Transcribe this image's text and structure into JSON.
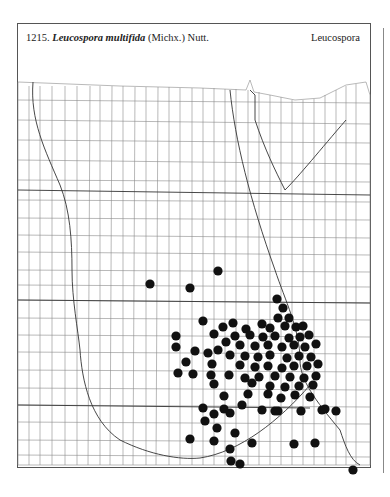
{
  "header": {
    "number": "1215.",
    "species": "Leucospora multifida",
    "authority": "(Michx.) Nutt.",
    "genus": "Leucospora"
  },
  "map": {
    "dot_color": "#111111",
    "line_color": "#777777",
    "dot_radius": 4.6,
    "occurrences": [
      [
        150,
        284
      ],
      [
        190,
        288
      ],
      [
        218,
        271
      ],
      [
        353,
        470
      ],
      [
        277,
        299
      ],
      [
        283,
        308
      ],
      [
        278,
        318
      ],
      [
        289,
        318
      ],
      [
        203,
        321
      ],
      [
        233,
        323
      ],
      [
        223,
        327
      ],
      [
        246,
        329
      ],
      [
        262,
        324
      ],
      [
        270,
        328
      ],
      [
        285,
        326
      ],
      [
        296,
        327
      ],
      [
        303,
        326
      ],
      [
        176,
        336
      ],
      [
        214,
        334
      ],
      [
        235,
        336
      ],
      [
        250,
        335
      ],
      [
        263,
        337
      ],
      [
        275,
        336
      ],
      [
        289,
        338
      ],
      [
        300,
        337
      ],
      [
        309,
        335
      ],
      [
        176,
        347
      ],
      [
        226,
        342
      ],
      [
        240,
        345
      ],
      [
        255,
        346
      ],
      [
        268,
        345
      ],
      [
        282,
        347
      ],
      [
        294,
        345
      ],
      [
        305,
        347
      ],
      [
        316,
        344
      ],
      [
        195,
        351
      ],
      [
        208,
        353
      ],
      [
        218,
        350
      ],
      [
        230,
        355
      ],
      [
        245,
        356
      ],
      [
        258,
        357
      ],
      [
        270,
        355
      ],
      [
        287,
        358
      ],
      [
        299,
        356
      ],
      [
        311,
        357
      ],
      [
        186,
        362
      ],
      [
        212,
        364
      ],
      [
        240,
        365
      ],
      [
        255,
        367
      ],
      [
        268,
        366
      ],
      [
        282,
        368
      ],
      [
        294,
        366
      ],
      [
        307,
        366
      ],
      [
        318,
        364
      ],
      [
        178,
        373
      ],
      [
        193,
        374
      ],
      [
        211,
        375
      ],
      [
        229,
        375
      ],
      [
        245,
        378
      ],
      [
        259,
        377
      ],
      [
        275,
        376
      ],
      [
        290,
        377
      ],
      [
        304,
        378
      ],
      [
        316,
        376
      ],
      [
        214,
        384
      ],
      [
        252,
        383
      ],
      [
        270,
        386
      ],
      [
        285,
        387
      ],
      [
        299,
        386
      ],
      [
        313,
        385
      ],
      [
        224,
        396
      ],
      [
        248,
        394
      ],
      [
        268,
        394
      ],
      [
        281,
        398
      ],
      [
        295,
        395
      ],
      [
        310,
        397
      ],
      [
        203,
        408
      ],
      [
        230,
        413
      ],
      [
        262,
        410
      ],
      [
        278,
        411
      ],
      [
        301,
        411
      ],
      [
        322,
        410
      ],
      [
        214,
        414
      ],
      [
        224,
        409
      ],
      [
        205,
        421
      ],
      [
        235,
        433
      ],
      [
        252,
        443
      ],
      [
        275,
        411
      ],
      [
        242,
        405
      ],
      [
        190,
        439
      ],
      [
        214,
        441
      ],
      [
        217,
        428
      ],
      [
        230,
        449
      ],
      [
        231,
        461
      ],
      [
        240,
        464
      ],
      [
        294,
        444
      ],
      [
        315,
        443
      ],
      [
        325,
        409
      ],
      [
        336,
        411
      ]
    ]
  }
}
